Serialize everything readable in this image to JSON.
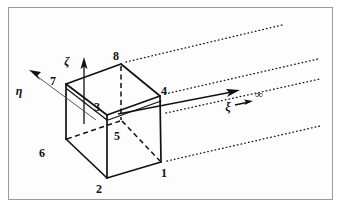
{
  "figure": {
    "kind": "technical-line-diagram",
    "background_color": "#ffffff",
    "ink_color": "#111111",
    "border_color": "#9a9a9a",
    "axes": [
      {
        "name": "zeta-axis",
        "symbol": "ζ",
        "label_x": 67,
        "label_y": 64,
        "direction": "up"
      },
      {
        "name": "eta-axis",
        "symbol": "η",
        "label_x": 18,
        "label_y": 94,
        "direction": "upper-left"
      },
      {
        "name": "xi-axis",
        "symbol": "ξ",
        "label_x": 226,
        "label_y": 110,
        "direction": "right"
      }
    ],
    "infinity": {
      "symbol": "∞",
      "label_x": 257,
      "label_y": 98
    },
    "nodes": [
      {
        "id": "8",
        "label": "8",
        "label_x": 116,
        "label_y": 60,
        "vx": 121,
        "vy": 64
      },
      {
        "id": "7",
        "label": "7",
        "label_x": 53,
        "label_y": 85,
        "vx": 66,
        "vy": 84
      },
      {
        "id": "4",
        "label": "4",
        "label_x": 163,
        "label_y": 95,
        "vx": 160,
        "vy": 96
      },
      {
        "id": "3",
        "label": "3",
        "label_x": 97,
        "label_y": 111,
        "vx": 107,
        "vy": 115
      },
      {
        "id": "5",
        "label": "5",
        "label_x": 117,
        "label_y": 140,
        "vx": 121,
        "vy": 120
      },
      {
        "id": "6",
        "label": "6",
        "label_x": 42,
        "label_y": 157,
        "vx": 66,
        "vy": 139
      },
      {
        "id": "1",
        "label": "1",
        "label_x": 163,
        "label_y": 177,
        "vx": 161,
        "vy": 162
      },
      {
        "id": "2",
        "label": "2",
        "label_x": 99,
        "label_y": 193,
        "vx": 107,
        "vy": 178
      }
    ],
    "dotted_lines_count": 4
  }
}
